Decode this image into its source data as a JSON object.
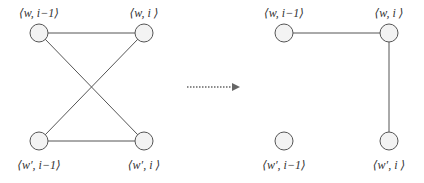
{
  "diagram": {
    "type": "graph-transformation",
    "colors": {
      "edge": "#555555",
      "node_fill": "#f3f3f3",
      "text": "#333333"
    },
    "left_graph": {
      "nodes": [
        {
          "id": "tl",
          "label": "⟨w, i−1⟩",
          "x": 39,
          "y": 33
        },
        {
          "id": "tr",
          "label": "⟨w, i ⟩",
          "x": 144,
          "y": 33
        },
        {
          "id": "bl",
          "label": "⟨w′, i−1⟩",
          "x": 39,
          "y": 141
        },
        {
          "id": "br",
          "label": "⟨w′, i ⟩",
          "x": 144,
          "y": 141
        }
      ],
      "edges": [
        [
          "tl",
          "tr"
        ],
        [
          "bl",
          "br"
        ],
        [
          "tl",
          "br"
        ],
        [
          "tr",
          "bl"
        ]
      ]
    },
    "arrow": {
      "style": "dotted",
      "from_x": 187,
      "to_x": 240,
      "y": 87
    },
    "right_graph": {
      "nodes": [
        {
          "id": "tl",
          "label": "⟨w, i−1⟩",
          "x": 284,
          "y": 33
        },
        {
          "id": "tr",
          "label": "⟨w, i ⟩",
          "x": 389,
          "y": 33
        },
        {
          "id": "bl",
          "label": "⟨w′, i−1⟩",
          "x": 284,
          "y": 141
        },
        {
          "id": "br",
          "label": "⟨w′, i ⟩",
          "x": 389,
          "y": 141
        }
      ],
      "edges": [
        [
          "tl",
          "tr"
        ],
        [
          "tr",
          "br"
        ]
      ]
    }
  }
}
